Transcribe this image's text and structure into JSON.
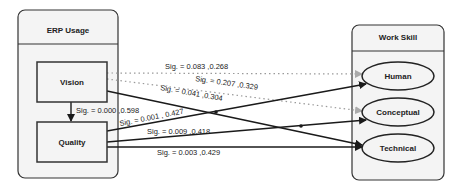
{
  "groups": {
    "left": {
      "title": "ERP Usage",
      "nodes": [
        "Vision",
        "Quality"
      ]
    },
    "right": {
      "title": "Work Skill",
      "nodes": [
        "Human",
        "Conceptual",
        "Technical"
      ]
    }
  },
  "edges": [
    {
      "from": "Vision",
      "to": "Human",
      "style": "dotted",
      "label": "Sig. = 0.083 ,0.268"
    },
    {
      "from": "Vision",
      "to": "Conceptual",
      "style": "dotted",
      "label": "Sig. = 0.207 ,0.329"
    },
    {
      "from": "Vision",
      "to": "Technical",
      "style": "solid",
      "label": "Sig. = 0.041 ,0.304"
    },
    {
      "from": "Vision",
      "to": "Quality",
      "style": "solid",
      "label": "Sig. = 0.000 ,0.598"
    },
    {
      "from": "Quality",
      "to": "Human",
      "style": "solid",
      "label": "Sig. = 0.001 , 0.427"
    },
    {
      "from": "Quality",
      "to": "Conceptual",
      "style": "solid",
      "label": "Sig. = 0.009 ,0.418"
    },
    {
      "from": "Quality",
      "to": "Technical",
      "style": "solid",
      "label": "Sig. = 0.003 ,0.429"
    }
  ],
  "colors": {
    "line": "#1a1a1a",
    "dotted": "#9a9a9a",
    "box_fill": "#f4f4f4",
    "border": "#333333"
  }
}
